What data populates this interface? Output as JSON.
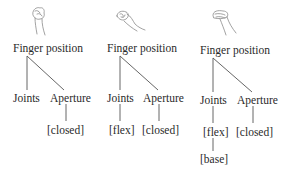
{
  "trees": [
    {
      "hand_icon": "closed-fist-hand-icon",
      "root": "Finger position",
      "joints": {
        "label": "Joints",
        "children": []
      },
      "aperture": {
        "label": "Aperture",
        "children": [
          "[closed]"
        ]
      }
    },
    {
      "hand_icon": "curled-fingers-hand-icon",
      "root": "Finger position",
      "joints": {
        "label": "Joints",
        "children": [
          "[flex]"
        ]
      },
      "aperture": {
        "label": "Aperture",
        "children": [
          "[closed]"
        ]
      }
    },
    {
      "hand_icon": "flexed-base-hand-icon",
      "root": "Finger position",
      "joints": {
        "label": "Joints",
        "children": [
          "[flex]",
          "[base]"
        ]
      },
      "aperture": {
        "label": "Aperture",
        "children": [
          "[closed]"
        ]
      }
    }
  ]
}
